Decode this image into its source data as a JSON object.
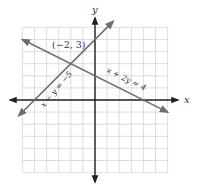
{
  "chart_data": {
    "type": "line",
    "title": "",
    "xlabel": "x",
    "ylabel": "y",
    "xlim": [
      -6,
      6
    ],
    "ylim": [
      -6,
      6
    ],
    "grid": true,
    "series": [
      {
        "name": "x - y = -5",
        "label": "x − y = −5",
        "equation": "y = x + 5",
        "points": [
          [
            -6.3,
            -1.3
          ],
          [
            1.5,
            6.5
          ]
        ],
        "color": "#6e6e6e"
      },
      {
        "name": "x + 2y = 4",
        "label": "x + 2y = 4",
        "equation": "y = (4 - x)/2",
        "points": [
          [
            -6,
            5
          ],
          [
            6,
            -1
          ]
        ],
        "color": "#6e6e6e"
      }
    ],
    "annotations": [
      {
        "text": "(−2, 3)",
        "point": [
          -2,
          3
        ]
      }
    ]
  },
  "labels": {
    "x_axis": "x",
    "y_axis": "y",
    "intersection": "(−2, 3)",
    "line1": "x − y = −5",
    "line2": "x + 2y = 4"
  }
}
